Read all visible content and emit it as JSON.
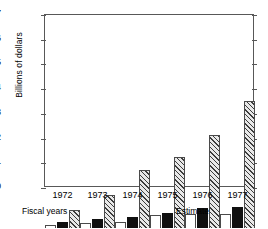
{
  "chart_data": {
    "type": "bar",
    "title": "",
    "xlabel": "Fiscal years",
    "ylabel": "Billions of dollars",
    "categories": [
      "1972",
      "1973",
      "1974",
      "1975",
      "1976",
      "1977"
    ],
    "ylim": [
      0,
      7
    ],
    "yticks": [
      0,
      1,
      2,
      3,
      4,
      5,
      6,
      7
    ],
    "grid": false,
    "legend": "none",
    "annotations": [
      {
        "text": "Fiscal years",
        "position": "bottom-left"
      },
      {
        "text": "Estimate",
        "position": "bottom-right"
      }
    ],
    "series": [
      {
        "name": "open-bar",
        "fill": "white",
        "values": [
          0.7,
          0.78,
          0.83,
          1.08,
          1.12,
          1.15
        ]
      },
      {
        "name": "solid-bar",
        "fill": "black",
        "values": [
          0.82,
          0.92,
          1.02,
          1.18,
          1.38,
          1.42
        ]
      },
      {
        "name": "hatched-bar",
        "fill": "diagonal-hatch",
        "values": [
          1.28,
          1.9,
          2.9,
          3.45,
          4.35,
          5.7
        ]
      }
    ]
  },
  "axis": {
    "y_title": "Billions of dollars",
    "tick_labels": [
      "0",
      "1",
      "2",
      "3",
      "4",
      "5",
      "6",
      "7"
    ]
  },
  "footer": {
    "left_note": "Fiscal years",
    "right_note": "Estimate"
  }
}
